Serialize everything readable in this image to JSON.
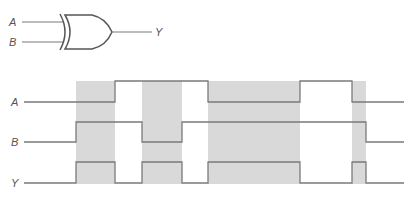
{
  "gate": {
    "type": "XOR",
    "inputs": [
      {
        "label": "A"
      },
      {
        "label": "B"
      }
    ],
    "output": {
      "label": "Y"
    }
  },
  "timing": {
    "signals": [
      {
        "label": "A",
        "levels": [
          0,
          1,
          0,
          1,
          0
        ],
        "transitions_x": [
          115,
          208,
          300,
          352
        ]
      },
      {
        "label": "B",
        "levels": [
          0,
          1,
          0,
          1,
          0
        ],
        "transitions_x": [
          76,
          142,
          182,
          366
        ]
      },
      {
        "label": "Y",
        "levels": [
          0,
          1,
          0,
          1,
          0,
          1,
          0,
          1,
          0
        ],
        "transitions_x": [
          76,
          115,
          142,
          182,
          208,
          300,
          352,
          366
        ]
      }
    ],
    "shaded_intervals": [
      [
        76,
        115
      ],
      [
        142,
        182
      ],
      [
        208,
        300
      ],
      [
        352,
        366
      ]
    ],
    "colors": {
      "shade": "#d9d9d9",
      "line": "#7a7a7a",
      "label": "#555555"
    }
  }
}
